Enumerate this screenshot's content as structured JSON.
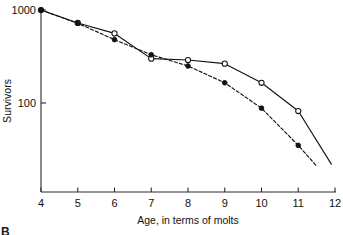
{
  "panel": {
    "label": "B"
  },
  "chart_data": {
    "type": "line",
    "title": "",
    "xlabel": "Age, in terms of molts",
    "ylabel": "Survivors",
    "yscale": "log",
    "xlim": [
      4,
      12
    ],
    "ylim": [
      20,
      1000
    ],
    "grid": false,
    "legend": "none",
    "xticks": [
      4,
      5,
      6,
      7,
      8,
      9,
      10,
      11,
      12
    ],
    "xticklabels": [
      "4",
      "5",
      "6",
      "7",
      "8",
      "9",
      "10",
      "11",
      "12"
    ],
    "yticks": [
      100,
      1000
    ],
    "yticklabels": [
      "100",
      "1000"
    ],
    "series": [
      {
        "name": "open-circle-series",
        "marker": "open-circle",
        "linestyle": "solid",
        "x": [
          4,
          5,
          6,
          7,
          8,
          9,
          10,
          11,
          11.9
        ],
        "values": [
          1000,
          725,
          560,
          300,
          290,
          265,
          165,
          82,
          22
        ]
      },
      {
        "name": "filled-circle-series",
        "marker": "filled-circle",
        "linestyle": "dashed",
        "x": [
          4,
          5,
          6,
          7,
          8,
          9,
          10,
          11,
          11.5
        ],
        "values": [
          1000,
          720,
          480,
          330,
          250,
          165,
          88,
          35,
          21
        ]
      }
    ]
  }
}
